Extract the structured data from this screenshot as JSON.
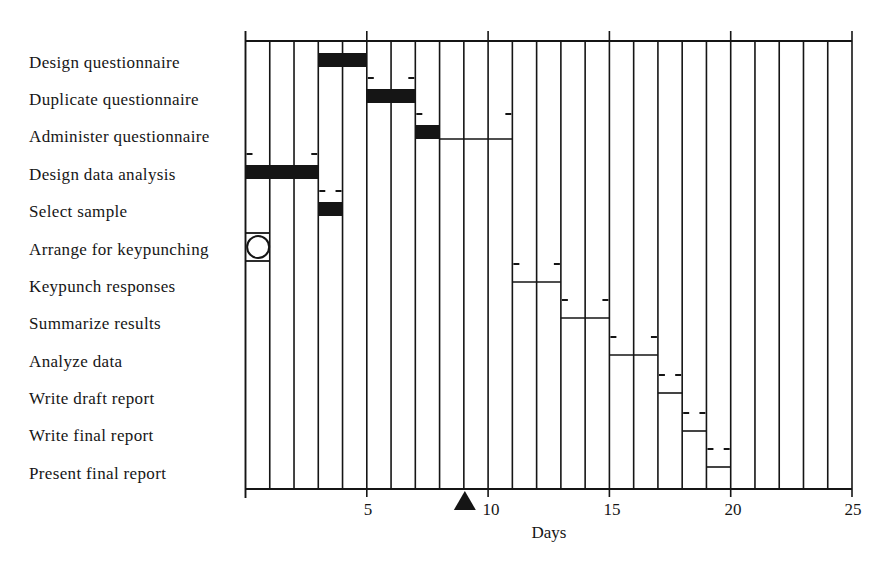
{
  "chart_data": {
    "type": "gantt",
    "title": "",
    "xlabel": "Days",
    "ylabel": "",
    "xlim": [
      0,
      25
    ],
    "x_ticks": [
      5,
      10,
      15,
      20,
      25
    ],
    "x_tick_labels": [
      "5",
      "10",
      "15",
      "20",
      "25"
    ],
    "grid": "vertical line at every day (0-25)",
    "legend": null,
    "current_day_marker": {
      "day": 9,
      "shape": "filled triangle",
      "position": "below x-axis"
    },
    "colors": {
      "ink": "#151515",
      "background": "#ffffff"
    },
    "tasks": [
      {
        "name": "Design questionnaire",
        "start": 3,
        "end": 5,
        "completed_to": 5,
        "milestone": false,
        "brackets": false
      },
      {
        "name": "Duplicate questionnaire",
        "start": 5,
        "end": 7,
        "completed_to": 7,
        "milestone": false,
        "brackets": true
      },
      {
        "name": "Administer questionnaire",
        "start": 7,
        "end": 11,
        "completed_to": 8,
        "milestone": false,
        "brackets": true
      },
      {
        "name": "Design data analysis",
        "start": 0,
        "end": 3,
        "completed_to": 3,
        "milestone": false,
        "brackets": true
      },
      {
        "name": "Select sample",
        "start": 3,
        "end": 4,
        "completed_to": 4,
        "milestone": false,
        "brackets": true
      },
      {
        "name": "Arrange for keypunching",
        "start": 0,
        "end": 1,
        "completed_to": null,
        "milestone": true,
        "brackets": false
      },
      {
        "name": "Keypunch responses",
        "start": 11,
        "end": 13,
        "completed_to": null,
        "milestone": false,
        "brackets": true
      },
      {
        "name": "Summarize results",
        "start": 13,
        "end": 15,
        "completed_to": null,
        "milestone": false,
        "brackets": true
      },
      {
        "name": "Analyze data",
        "start": 15,
        "end": 17,
        "completed_to": null,
        "milestone": false,
        "brackets": true
      },
      {
        "name": "Write draft report",
        "start": 17,
        "end": 18,
        "completed_to": null,
        "milestone": false,
        "brackets": true
      },
      {
        "name": "Write final report",
        "start": 18,
        "end": 19,
        "completed_to": null,
        "milestone": false,
        "brackets": true
      },
      {
        "name": "Present final report",
        "start": 19,
        "end": 20,
        "completed_to": null,
        "milestone": false,
        "brackets": true
      }
    ]
  }
}
